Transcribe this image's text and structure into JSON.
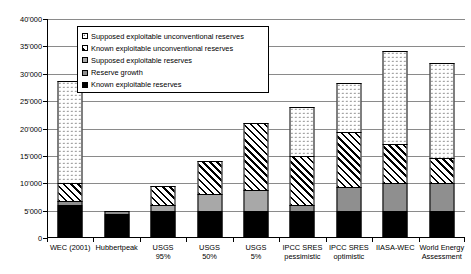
{
  "chart_data": {
    "type": "bar",
    "stacked": true,
    "title": "",
    "xlabel": "",
    "ylabel": "",
    "ylim": [
      0,
      40000
    ],
    "ytick_step": 5000,
    "ytick_labels": [
      "0",
      "5'000",
      "10'000",
      "15'000",
      "20'000",
      "25'000",
      "30'000",
      "35'000",
      "40'000"
    ],
    "ytick_values": [
      0,
      5000,
      10000,
      15000,
      20000,
      25000,
      30000,
      35000,
      40000
    ],
    "grid": true,
    "legend_position": "inside-top-left",
    "categories": [
      "WEC (2001)",
      "Hubbertpeak",
      "USGS\n95%",
      "USGS\n50%",
      "USGS\n5%",
      "IPCC SRES\npessimistic",
      "IPCC SRES\noptimistic",
      "IIASA-WEC",
      "World Energy\nAssessment"
    ],
    "series": [
      {
        "name": "Known exploitable reserves",
        "pattern": "solid-black",
        "color": "#000000",
        "values": [
          6000,
          4300,
          5000,
          5000,
          5000,
          5000,
          5000,
          5000,
          5000
        ]
      },
      {
        "name": "Reserve growth",
        "pattern": "solid-gray",
        "color": "#8f8f8f",
        "values": [
          700,
          700,
          0,
          0,
          0,
          1000,
          4300,
          5000,
          5000
        ]
      },
      {
        "name": "Supposed exploitable reserves",
        "pattern": "solid-light-gray",
        "color": "#a8a8a8",
        "values": [
          0,
          0,
          1000,
          3000,
          3700,
          0,
          0,
          0,
          0
        ]
      },
      {
        "name": "Known exploitable unconventional reserves",
        "pattern": "diagonal-hatch",
        "color": "#ffffff",
        "values": [
          3300,
          0,
          3500,
          6000,
          12300,
          9000,
          10000,
          7200,
          4700
        ]
      },
      {
        "name": "Supposed exploitable unconventional reserves",
        "pattern": "dotted",
        "color": "#ffffff",
        "values": [
          18700,
          0,
          0,
          0,
          0,
          9000,
          9000,
          17000,
          17300
        ]
      }
    ],
    "totals": [
      28700,
      5000,
      9500,
      14000,
      21000,
      24000,
      28300,
      34200,
      32000
    ]
  },
  "legend": {
    "entries": [
      {
        "label": "Supposed exploitable unconventional reserves",
        "swatch": "dotted"
      },
      {
        "label": "Known exploitable unconventional reserves",
        "swatch": "diagonal-hatch"
      },
      {
        "label": "Supposed exploitable reserves",
        "swatch": "solid-light-gray"
      },
      {
        "label": "Reserve growth",
        "swatch": "solid-gray"
      },
      {
        "label": "Known exploitable reserves",
        "swatch": "solid-black"
      }
    ]
  }
}
